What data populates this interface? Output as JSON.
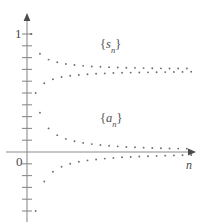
{
  "figure": {
    "kind": "math-plot",
    "background_color": "#ffffff",
    "axis_color": "#808080",
    "point_color": "#6e6e6e",
    "text_color": "#4a4a4a"
  },
  "labels": {
    "y_one": "1",
    "origin": "0",
    "x_axis_variable": "n",
    "upper_sequence": {
      "open": "{",
      "symbol": "s",
      "subscript": "n",
      "close": "}"
    },
    "lower_sequence": {
      "open": "{",
      "symbol": "a",
      "subscript": "n",
      "close": "}"
    }
  },
  "chart_data": {
    "type": "scatter",
    "title": "",
    "xlabel": "n",
    "ylabel": "",
    "xlim": [
      0,
      40
    ],
    "ylim": [
      -1.05,
      1.25
    ],
    "grid": false,
    "legend": "inline-annotations",
    "annotations": [
      {
        "text": "{s_n}",
        "x": 17,
        "y": 0.93
      },
      {
        "text": "{a_n}",
        "x": 17,
        "y": 0.3
      }
    ],
    "yticks": [
      1
    ],
    "ytick_labels": [
      "1"
    ],
    "axis_ticks_note": "unlabeled minor ticks evenly spaced along the y-axis",
    "series": [
      {
        "name": "{s_n}",
        "description": "partial sums of the alternating harmonic series, converging to ln 2",
        "x": [
          1,
          2,
          3,
          4,
          5,
          6,
          7,
          8,
          9,
          10,
          11,
          12,
          13,
          14,
          15,
          16,
          17,
          18,
          19,
          20,
          21,
          22,
          23,
          24,
          25,
          26,
          27,
          28,
          29,
          30,
          31,
          32,
          33,
          34,
          35,
          36,
          37,
          38
        ],
        "values": [
          1.0,
          0.5,
          0.833,
          0.583,
          0.783,
          0.617,
          0.76,
          0.635,
          0.746,
          0.646,
          0.737,
          0.653,
          0.73,
          0.659,
          0.725,
          0.663,
          0.722,
          0.666,
          0.719,
          0.669,
          0.716,
          0.671,
          0.714,
          0.673,
          0.713,
          0.674,
          0.711,
          0.675,
          0.71,
          0.676,
          0.709,
          0.677,
          0.708,
          0.678,
          0.708,
          0.679,
          0.707,
          0.68
        ]
      },
      {
        "name": "{a_n}",
        "description": "alternating harmonic terms (-1)^(n+1)/n, converging to 0",
        "x": [
          1,
          2,
          3,
          4,
          5,
          6,
          7,
          8,
          9,
          10,
          11,
          12,
          13,
          14,
          15,
          16,
          17,
          18,
          19,
          20,
          21,
          22,
          23,
          24,
          25,
          26,
          27,
          28,
          29,
          30,
          31,
          32,
          33,
          34,
          35,
          36,
          37,
          38
        ],
        "values": [
          1.0,
          -0.5,
          0.333,
          -0.25,
          0.2,
          -0.167,
          0.143,
          -0.125,
          0.111,
          -0.1,
          0.091,
          -0.083,
          0.077,
          -0.071,
          0.067,
          -0.063,
          0.059,
          -0.056,
          0.053,
          -0.05,
          0.048,
          -0.045,
          0.043,
          -0.042,
          0.04,
          -0.038,
          0.037,
          -0.036,
          0.034,
          -0.033,
          0.032,
          -0.031,
          0.03,
          -0.029,
          0.029,
          -0.028,
          0.027,
          -0.026
        ]
      }
    ]
  }
}
